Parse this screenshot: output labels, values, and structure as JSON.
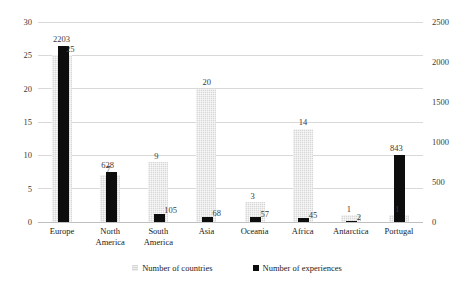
{
  "chart_data": {
    "type": "bar",
    "title": "",
    "subtitle": "",
    "xlabel": "",
    "ylabel": "",
    "grid": true,
    "legend_position": "bottom",
    "categories": [
      "Europe",
      "North America",
      "South America",
      "Asia",
      "Oceania",
      "Africa",
      "Antarctica",
      "Portugal"
    ],
    "series": [
      {
        "name": "Number of countries",
        "axis": "left",
        "color": "#d7d7d7",
        "values": [
          25,
          7,
          9,
          20,
          3,
          14,
          1,
          1
        ]
      },
      {
        "name": "Number of experiences",
        "axis": "right",
        "color": "#0d0d0d",
        "values": [
          2203,
          628,
          105,
          68,
          57,
          45,
          2,
          843
        ]
      }
    ],
    "left_axis": {
      "label": "",
      "ylim": [
        0,
        30
      ],
      "ticks": [
        0,
        5,
        10,
        15,
        20,
        25,
        30
      ],
      "tick_labels": [
        "0",
        "5",
        "10",
        "15",
        "20",
        "25",
        "30"
      ]
    },
    "right_axis": {
      "label": "",
      "ylim": [
        0,
        2500
      ],
      "ticks": [
        0,
        500,
        1000,
        1500,
        2000,
        2500
      ],
      "tick_labels": [
        "0",
        "500",
        "1000",
        "1500",
        "2000",
        "2500"
      ]
    },
    "data_labels": {
      "countries": [
        "25",
        "7",
        "9",
        "20",
        "3",
        "14",
        "1",
        "1"
      ],
      "experiences": [
        "2203",
        "628",
        "105",
        "68",
        "57",
        "45",
        "2",
        "843"
      ]
    }
  },
  "legend": {
    "items": [
      {
        "label": "Number of countries",
        "swatch": "countries-swatch-icon"
      },
      {
        "label": "Number of experiences",
        "swatch": "experiences-swatch-icon"
      }
    ]
  }
}
